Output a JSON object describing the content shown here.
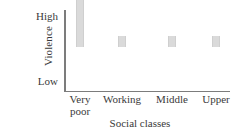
{
  "chart_data": {
    "type": "bar",
    "title": "",
    "subtitle": "",
    "xlabel": "Social classes",
    "ylabel": "Violence",
    "categories": [
      "Very poor",
      "Working",
      "Middle",
      "Upper"
    ],
    "category_lines": [
      [
        "Very",
        "poor"
      ],
      [
        "Working"
      ],
      [
        "Middle"
      ],
      [
        "Upper"
      ]
    ],
    "values": [
      1.0,
      0.15,
      0.15,
      0.15
    ],
    "ylim": [
      0,
      1.0
    ],
    "ytick_values": [
      0.15,
      1.0
    ],
    "ytick_labels": [
      "Low",
      "High"
    ],
    "grid": false,
    "legend": null,
    "annotations": [],
    "bar_color": "#dadada",
    "axis_color": "#7c7c7c",
    "text_color": "#3a3a3a",
    "background_color": "#ffffff"
  },
  "axes": {
    "y_title": "Violence",
    "x_title": "Social classes",
    "y_tick_high": "High",
    "y_tick_low": "Low"
  },
  "bars": [
    {
      "label": "Very poor",
      "line1": "Very",
      "line2": "poor",
      "value_label": "High",
      "left": 76,
      "top": 10,
      "height": 80
    },
    {
      "label": "Working",
      "line1": "Working",
      "line2": "",
      "value_label": "Low",
      "left": 118,
      "top": 79,
      "height": 11
    },
    {
      "label": "Middle",
      "line1": "Middle",
      "line2": "",
      "value_label": "Low",
      "left": 168,
      "top": 79,
      "height": 11
    },
    {
      "label": "Upper",
      "line1": "Upper",
      "line2": "",
      "value_label": "Low",
      "left": 212,
      "top": 79,
      "height": 11
    }
  ]
}
